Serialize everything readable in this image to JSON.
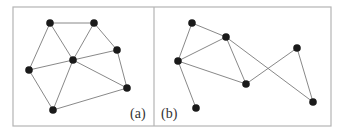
{
  "figure": {
    "frame": {
      "x": 13,
      "y": 7,
      "width": 318,
      "height": 119,
      "divider_x": 154,
      "color": "#b4b4b4"
    },
    "node_color": "#1a1a1a",
    "edge_color": "#7a7a7a",
    "panels": [
      {
        "id": "a",
        "label": "(a)",
        "label_pos": {
          "x": 130,
          "y": 118
        },
        "nodes": [
          {
            "id": "A",
            "x": 50,
            "y": 23
          },
          {
            "id": "B",
            "x": 94,
            "y": 23
          },
          {
            "id": "C",
            "x": 117,
            "y": 50
          },
          {
            "id": "D",
            "x": 73,
            "y": 60
          },
          {
            "id": "E",
            "x": 29,
            "y": 70
          },
          {
            "id": "F",
            "x": 127,
            "y": 88
          },
          {
            "id": "G",
            "x": 53,
            "y": 110
          }
        ],
        "edges": [
          [
            "A",
            "B"
          ],
          [
            "A",
            "E"
          ],
          [
            "A",
            "D"
          ],
          [
            "B",
            "D"
          ],
          [
            "B",
            "C"
          ],
          [
            "D",
            "C"
          ],
          [
            "E",
            "D"
          ],
          [
            "D",
            "G"
          ],
          [
            "D",
            "F"
          ],
          [
            "C",
            "F"
          ],
          [
            "E",
            "G"
          ],
          [
            "G",
            "F"
          ]
        ]
      },
      {
        "id": "b",
        "label": "(b)",
        "label_pos": {
          "x": 161,
          "y": 118
        },
        "nodes": [
          {
            "id": "P",
            "x": 192,
            "y": 23
          },
          {
            "id": "Q",
            "x": 226,
            "y": 37
          },
          {
            "id": "R",
            "x": 178,
            "y": 61
          },
          {
            "id": "S",
            "x": 297,
            "y": 48
          },
          {
            "id": "T",
            "x": 246,
            "y": 84
          },
          {
            "id": "U",
            "x": 313,
            "y": 102
          },
          {
            "id": "V",
            "x": 196,
            "y": 108
          }
        ],
        "edges": [
          [
            "P",
            "Q"
          ],
          [
            "P",
            "R"
          ],
          [
            "Q",
            "R"
          ],
          [
            "Q",
            "T"
          ],
          [
            "Q",
            "U"
          ],
          [
            "R",
            "T"
          ],
          [
            "R",
            "V"
          ],
          [
            "T",
            "S"
          ],
          [
            "S",
            "U"
          ]
        ]
      }
    ]
  }
}
